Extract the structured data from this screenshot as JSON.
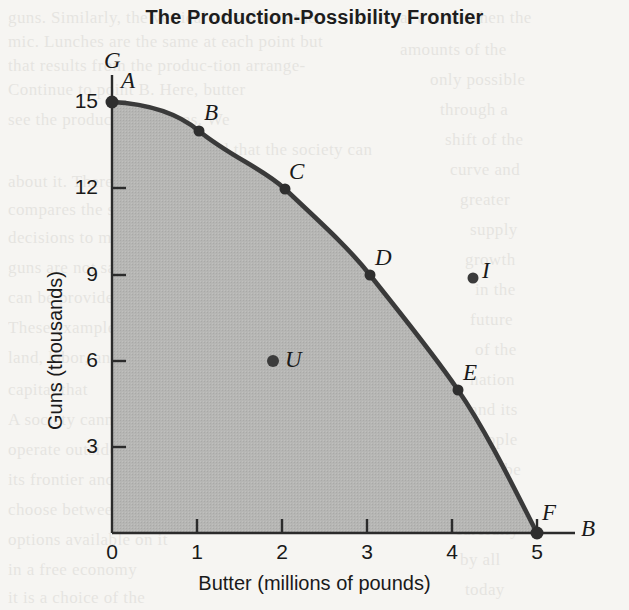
{
  "chart_data": {
    "type": "line",
    "title": "The Production-Possibility Frontier",
    "xlabel": "Butter (millions of pounds)",
    "ylabel": "Guns (thousands)",
    "xlim": [
      0,
      5
    ],
    "ylim": [
      0,
      15
    ],
    "grid": false,
    "legend": null,
    "x_axis_end_label": "B",
    "y_axis_end_label": "G",
    "xticks": [
      0,
      1,
      2,
      3,
      4,
      5
    ],
    "xtick_labels": [
      "0",
      "1",
      "2",
      "3",
      "4",
      "5"
    ],
    "yticks": [
      3,
      6,
      9,
      12,
      15
    ],
    "ytick_labels": [
      "3",
      "6",
      "9",
      "12",
      "15"
    ],
    "shaded_region_label": "feasible production set",
    "shaded_region_color": "#b4b4b2",
    "curve_color": "#3a3a3a",
    "series": [
      {
        "name": "Production-possibility frontier",
        "points": [
          {
            "label": "A",
            "x": 0,
            "y": 15
          },
          {
            "label": "B",
            "x": 1,
            "y": 14
          },
          {
            "label": "C",
            "x": 2,
            "y": 12
          },
          {
            "label": "D",
            "x": 3,
            "y": 9
          },
          {
            "label": "E",
            "x": 4,
            "y": 5
          },
          {
            "label": "F",
            "x": 5,
            "y": 0
          }
        ]
      }
    ],
    "annotations": [
      {
        "label": "U",
        "x": 2.0,
        "y": 6.0,
        "note": "inefficient point inside frontier"
      },
      {
        "label": "I",
        "x": 4.25,
        "y": 8.9,
        "note": "unattainable point outside frontier"
      }
    ]
  },
  "ghost_text": {
    "lines": [
      {
        "text": "guns. Similarly, the vertical axis shows the",
        "x": 8,
        "y": 8
      },
      {
        "text": "mic. Lunches are the same at each point but",
        "x": 8,
        "y": 32
      },
      {
        "text": "that results from the produc-tion arrange-",
        "x": 8,
        "y": 56
      },
      {
        "text": "Continue to point B. Here, butter",
        "x": 8,
        "y": 80
      },
      {
        "text": "see the production of guns. We",
        "x": 8,
        "y": 110
      },
      {
        "text": "find that the society can",
        "x": 200,
        "y": 140
      },
      {
        "text": "about it. There are more supplies",
        "x": 8,
        "y": 172
      },
      {
        "text": "compares the speed of the pro-",
        "x": 8,
        "y": 200
      },
      {
        "text": "decisions to make it through",
        "x": 8,
        "y": 228
      },
      {
        "text": "guns are not satisfied",
        "x": 8,
        "y": 258
      },
      {
        "text": "can be provided",
        "x": 8,
        "y": 288
      },
      {
        "text": "These examples",
        "x": 8,
        "y": 318
      },
      {
        "text": "land, labor, and",
        "x": 8,
        "y": 348
      },
      {
        "text": "capital that",
        "x": 8,
        "y": 380
      },
      {
        "text": "A society cannot",
        "x": 8,
        "y": 410
      },
      {
        "text": "operate outside",
        "x": 8,
        "y": 440
      },
      {
        "text": "its frontier and must",
        "x": 8,
        "y": 470
      },
      {
        "text": "choose between the",
        "x": 8,
        "y": 500
      },
      {
        "text": "options available on it",
        "x": 8,
        "y": 530
      },
      {
        "text": "in a free economy",
        "x": 8,
        "y": 560
      },
      {
        "text": "it is a choice of the",
        "x": 8,
        "y": 588
      },
      {
        "text": "at a time when the",
        "x": 400,
        "y": 8
      },
      {
        "text": "amounts of the",
        "x": 400,
        "y": 40
      },
      {
        "text": "only possible",
        "x": 430,
        "y": 70
      },
      {
        "text": "through a",
        "x": 440,
        "y": 100
      },
      {
        "text": "shift of the",
        "x": 445,
        "y": 130
      },
      {
        "text": "curve and",
        "x": 450,
        "y": 160
      },
      {
        "text": "greater",
        "x": 460,
        "y": 190
      },
      {
        "text": "supply",
        "x": 470,
        "y": 220
      },
      {
        "text": "growth",
        "x": 465,
        "y": 250
      },
      {
        "text": "in the",
        "x": 475,
        "y": 280
      },
      {
        "text": "future",
        "x": 470,
        "y": 310
      },
      {
        "text": "of the",
        "x": 475,
        "y": 340
      },
      {
        "text": "nation",
        "x": 470,
        "y": 370
      },
      {
        "text": "and its",
        "x": 470,
        "y": 400
      },
      {
        "text": "people",
        "x": 470,
        "y": 430
      },
      {
        "text": "must be",
        "x": 465,
        "y": 460
      },
      {
        "text": "weighed",
        "x": 460,
        "y": 490
      },
      {
        "text": "carefully",
        "x": 455,
        "y": 520
      },
      {
        "text": "by all",
        "x": 460,
        "y": 550
      },
      {
        "text": "today",
        "x": 465,
        "y": 580
      }
    ]
  }
}
